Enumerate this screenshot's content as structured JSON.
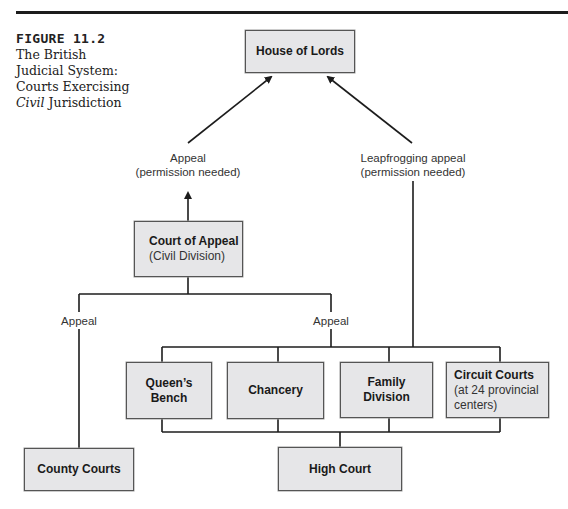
{
  "figure": {
    "number": "FIGURE 11.2",
    "caption_prefix": "The British Judicial System: Courts Exercising ",
    "caption_emph": "Civil",
    "caption_suffix": " Jurisdiction"
  },
  "nodes": {
    "house_of_lords": {
      "title": "House of Lords"
    },
    "court_of_appeal": {
      "title": "Court of Appeal",
      "sub": "(Civil Division)"
    },
    "queens_bench": {
      "title": "Queen’s Bench"
    },
    "chancery": {
      "title": "Chancery"
    },
    "family_division": {
      "title": "Family Division"
    },
    "circuit_courts": {
      "title": "Circuit Courts",
      "sub": "(at 24 provincial centers)"
    },
    "high_court": {
      "title": "High Court"
    },
    "county_courts": {
      "title": "County Courts"
    }
  },
  "edges": {
    "appeal_to_lords": {
      "line1": "Appeal",
      "line2": "(permission needed)"
    },
    "leapfrog_to_lords": {
      "line1": "Leapfrogging appeal",
      "line2": "(permission needed)"
    },
    "county_to_appeal": {
      "label": "Appeal"
    },
    "high_to_appeal": {
      "label": "Appeal"
    }
  },
  "colors": {
    "box_fill": "#e6e6e8",
    "line": "#1c1c1c",
    "text": "#1a1a1a"
  }
}
